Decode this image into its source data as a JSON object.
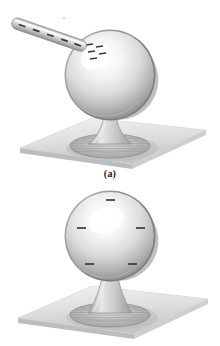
{
  "figure": {
    "title_a": "(a)",
    "title_b": "(b)",
    "panels": [
      {
        "id": "a",
        "label": "(a)",
        "description": "Charged rod touching a metal sphere on an insulating stand",
        "objects": [
          {
            "name": "charged-rod",
            "charge_marks": 5,
            "orientation": "diagonal-upper-left"
          },
          {
            "name": "metal-sphere",
            "charge_marks": 5,
            "charge_distribution": "clustered-near-contact-point"
          },
          {
            "name": "insulating-stand",
            "parts": [
              "stem",
              "base-disc"
            ]
          },
          {
            "name": "tabletop",
            "shape": "parallelogram"
          }
        ]
      },
      {
        "id": "b",
        "label": "(b)",
        "description": "Metal sphere with charge spread uniformly over its surface",
        "objects": [
          {
            "name": "metal-sphere",
            "charge_marks": 5,
            "charge_distribution": "uniform"
          },
          {
            "name": "insulating-stand",
            "parts": [
              "stem",
              "base-disc"
            ]
          },
          {
            "name": "tabletop",
            "shape": "parallelogram"
          }
        ]
      }
    ]
  },
  "colors": {
    "background": "#ffffff",
    "sphere_highlight": "#ffffff",
    "sphere_mid": "#d9d9d9",
    "sphere_shadow": "#8d8d8d",
    "sphere_rim": "#6f6f6f",
    "rod_light": "#e6e6e6",
    "rod_dark": "#9a9a9a",
    "charge_mark": "#333333",
    "table_light": "#e3e3e3",
    "table_dark": "#b5b5b5",
    "table_edge": "#9f9f9f",
    "stand": "#cfcfcf",
    "caption_text": "#1a1a1a"
  }
}
